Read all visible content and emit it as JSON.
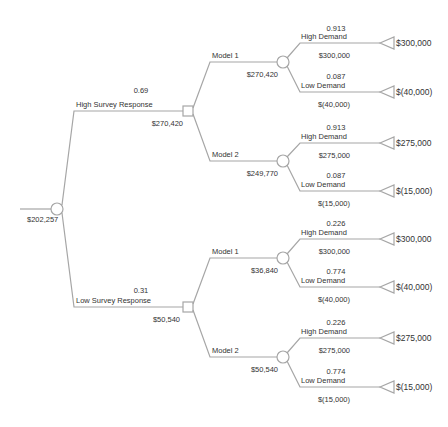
{
  "diagram": {
    "type": "decision-tree",
    "line_color": "#a6a6a6",
    "text_color": "#333333",
    "root": {
      "node_type": "chance",
      "expected_value": "$202,257"
    },
    "survey_branches": [
      {
        "label": "High Survey Response",
        "probability": "0.69",
        "decision_node_value": "$270,420",
        "models": [
          {
            "label": "Model 1",
            "chance_node_value": "$270,420",
            "outcomes": [
              {
                "label": "High Demand",
                "probability": "0.913",
                "branch_value": "$300,000",
                "payoff": "$300,000"
              },
              {
                "label": "Low Demand",
                "probability": "0.087",
                "branch_value": "$(40,000)",
                "payoff": "$(40,000)"
              }
            ]
          },
          {
            "label": "Model 2",
            "chance_node_value": "$249,770",
            "outcomes": [
              {
                "label": "High Demand",
                "probability": "0.913",
                "branch_value": "$275,000",
                "payoff": "$275,000"
              },
              {
                "label": "Low Demand",
                "probability": "0.087",
                "branch_value": "$(15,000)",
                "payoff": "$(15,000)"
              }
            ]
          }
        ]
      },
      {
        "label": "Low Survey Response",
        "probability": "0.31",
        "decision_node_value": "$50,540",
        "models": [
          {
            "label": "Model 1",
            "chance_node_value": "$36,840",
            "outcomes": [
              {
                "label": "High Demand",
                "probability": "0.226",
                "branch_value": "$300,000",
                "payoff": "$300,000"
              },
              {
                "label": "Low Demand",
                "probability": "0.774",
                "branch_value": "$(40,000)",
                "payoff": "$(40,000)"
              }
            ]
          },
          {
            "label": "Model 2",
            "chance_node_value": "$50,540",
            "outcomes": [
              {
                "label": "High Demand",
                "probability": "0.226",
                "branch_value": "$275,000",
                "payoff": "$275,000"
              },
              {
                "label": "Low Demand",
                "probability": "0.774",
                "branch_value": "$(15,000)",
                "payoff": "$(15,000)"
              }
            ]
          }
        ]
      }
    ]
  }
}
